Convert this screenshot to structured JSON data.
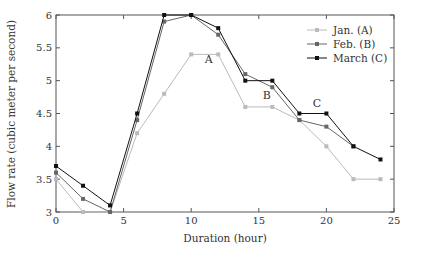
{
  "chart_data": {
    "type": "line",
    "title": "",
    "xlabel": "Duration (hour)",
    "ylabel": "Flow rate (cubic meter per second)",
    "xlim": [
      0,
      25
    ],
    "ylim": [
      3,
      6
    ],
    "xticks": [
      0,
      5,
      10,
      15,
      20,
      25
    ],
    "yticks": [
      3,
      3.5,
      4,
      4.5,
      5,
      5.5,
      6
    ],
    "grid": false,
    "legend_position": "upper right",
    "series": [
      {
        "name": "Jan. (A)",
        "color": "#bbbbbb",
        "marker": "square",
        "x": [
          0,
          2,
          4,
          6,
          8,
          10,
          12,
          14,
          16,
          18,
          20,
          22,
          24
        ],
        "y": [
          3.5,
          3.0,
          3.0,
          4.2,
          4.8,
          5.4,
          5.4,
          4.6,
          4.6,
          4.4,
          4.0,
          3.5,
          3.5
        ]
      },
      {
        "name": "Feb. (B)",
        "color": "#666666",
        "marker": "square",
        "x": [
          0,
          2,
          4,
          6,
          8,
          10,
          12,
          14,
          16,
          18,
          20,
          22
        ],
        "y": [
          3.6,
          3.2,
          3.0,
          4.4,
          5.9,
          6.0,
          5.7,
          5.1,
          4.9,
          4.4,
          4.3,
          4.0
        ]
      },
      {
        "name": "March (C)",
        "color": "#111111",
        "marker": "square",
        "x": [
          0,
          2,
          4,
          6,
          8,
          10,
          12,
          14,
          16,
          18,
          20,
          22,
          24
        ],
        "y": [
          3.7,
          3.4,
          3.1,
          4.5,
          6.0,
          6.0,
          5.8,
          5.0,
          5.0,
          4.5,
          4.5,
          4.0,
          3.8
        ]
      }
    ],
    "annotations": [
      {
        "text": "A",
        "x": 11.3,
        "y": 5.27
      },
      {
        "text": "B",
        "x": 15.6,
        "y": 4.72
      },
      {
        "text": "C",
        "x": 19.3,
        "y": 4.6
      }
    ]
  }
}
